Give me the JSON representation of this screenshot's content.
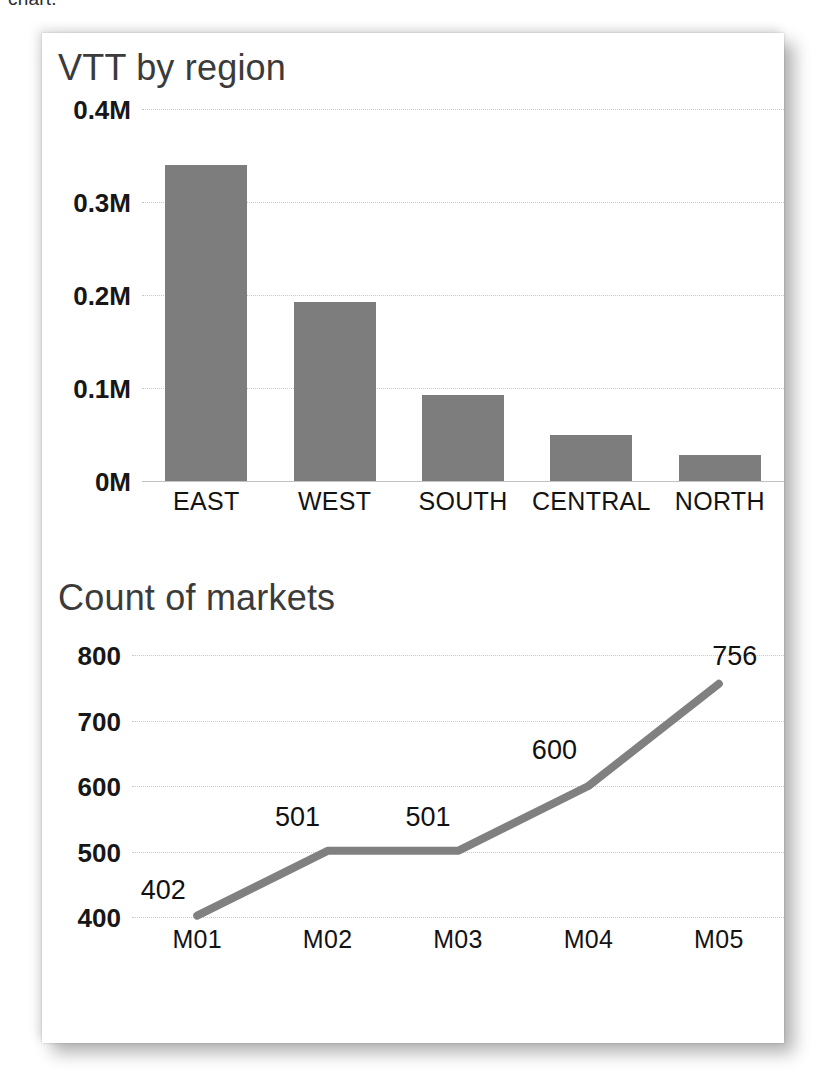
{
  "page": {
    "cut_off_text": "chart."
  },
  "card": {
    "background": "#ffffff"
  },
  "chart_data": [
    {
      "type": "bar",
      "title": "VTT by region",
      "xlabel": "",
      "ylabel": "",
      "categories": [
        "EAST",
        "WEST",
        "SOUTH",
        "CENTRAL",
        "NORTH"
      ],
      "values": [
        0.34,
        0.193,
        0.092,
        0.049,
        0.028
      ],
      "value_unit": "M",
      "ylim": [
        0,
        0.4
      ],
      "yticks": [
        0,
        0.1,
        0.2,
        0.3,
        0.4
      ],
      "ytick_labels": [
        "0M",
        "0.1M",
        "0.2M",
        "0.3M",
        "0.4M"
      ],
      "grid": true,
      "legend": "none",
      "series_color": "#7d7d7d",
      "data_labels": false
    },
    {
      "type": "line",
      "title": "Count of markets",
      "xlabel": "",
      "ylabel": "",
      "categories": [
        "M01",
        "M02",
        "M03",
        "M04",
        "M05"
      ],
      "values": [
        402,
        501,
        501,
        600,
        756
      ],
      "data_labels": [
        "402",
        "501",
        "501",
        "600",
        "756"
      ],
      "ylim": [
        400,
        800
      ],
      "yticks": [
        400,
        500,
        600,
        700,
        800
      ],
      "ytick_labels": [
        "400",
        "500",
        "600",
        "700",
        "800"
      ],
      "grid": true,
      "legend": "none",
      "series_color": "#808080",
      "line_width": 8
    }
  ]
}
